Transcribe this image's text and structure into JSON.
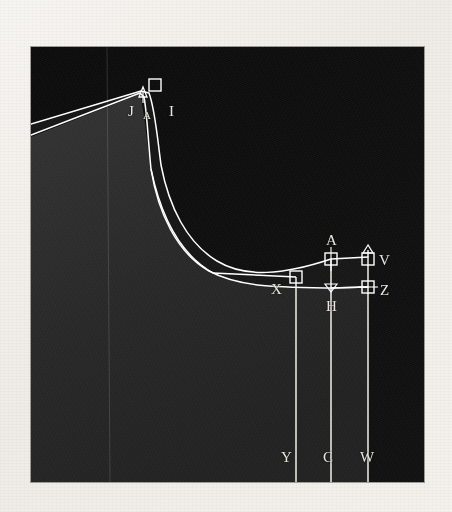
{
  "figure": {
    "kind": "annotated-contour-scan",
    "background_color": "#f4f2ee",
    "plate": {
      "x": 31,
      "y": 47,
      "width": 393,
      "height": 435,
      "dark_fill": "#0d0d0d",
      "mid_fill": "#2a2a2a",
      "trace_color": "#ffffff",
      "label_color": "#e9e6df"
    }
  },
  "labels": [
    {
      "id": "J",
      "text": "J",
      "x": 97,
      "y": 64,
      "size": "normal"
    },
    {
      "id": "A_peak",
      "text": "A",
      "x": 113,
      "y": 70,
      "size": "small"
    },
    {
      "id": "I",
      "text": "I",
      "x": 138,
      "y": 64,
      "size": "normal"
    },
    {
      "id": "A_right",
      "text": "A",
      "x": 287,
      "y": 188,
      "size": "normal"
    },
    {
      "id": "V",
      "text": "V",
      "x": 347,
      "y": 210,
      "size": "normal"
    },
    {
      "id": "X",
      "text": "X",
      "x": 237,
      "y": 235,
      "size": "normal"
    },
    {
      "id": "H",
      "text": "H",
      "x": 288,
      "y": 252,
      "size": "normal"
    },
    {
      "id": "Z",
      "text": "Z",
      "x": 350,
      "y": 238,
      "size": "normal"
    },
    {
      "id": "Y",
      "text": "Y",
      "x": 252,
      "y": 406,
      "size": "normal"
    },
    {
      "id": "C",
      "text": "C",
      "x": 288,
      "y": 406,
      "size": "normal"
    },
    {
      "id": "W",
      "text": "W",
      "x": 327,
      "y": 406,
      "size": "normal"
    }
  ],
  "markers": [
    {
      "id": "I",
      "shape": "square",
      "x": 123,
      "y": 38
    },
    {
      "id": "A_peak",
      "shape": "arrow-up",
      "x": 112,
      "y": 44
    },
    {
      "id": "A_right",
      "shape": "square",
      "x": 300,
      "y": 212
    },
    {
      "id": "V",
      "shape": "square",
      "x": 337,
      "y": 212
    },
    {
      "id": "V_tick",
      "shape": "arrow-up",
      "x": 337,
      "y": 203
    },
    {
      "id": "X",
      "shape": "square",
      "x": 265,
      "y": 230
    },
    {
      "id": "H",
      "shape": "arrow-down",
      "x": 300,
      "y": 241
    },
    {
      "id": "Z",
      "shape": "square",
      "x": 337,
      "y": 240
    }
  ],
  "vertical_rules": [
    {
      "id": "faint-left",
      "x": 76,
      "y_top": 0,
      "y_bottom": 435,
      "opacity": 0.22
    },
    {
      "id": "Y-rule",
      "x": 265,
      "y_top": 230,
      "y_bottom": 435,
      "opacity": 1
    },
    {
      "id": "C-rule",
      "x": 300,
      "y_top": 212,
      "y_bottom": 435,
      "opacity": 1
    },
    {
      "id": "W-rule",
      "x": 337,
      "y_top": 205,
      "y_bottom": 435,
      "opacity": 1
    }
  ],
  "traces": {
    "outer_curve": "M 0,77 L 110,44 L 118,46 C 124,62 126,88 130,118 C 138,160 156,196 186,214 C 214,231 252,228 300,212 L 337,210",
    "inner_curve": "M 0,88 L 109,46 L 113,50 C 116,66 117,92 120,122 C 127,166 146,206 178,224 C 208,240 242,240 300,241 L 337,240",
    "connector": "M 186,214 L 265,230"
  },
  "regions": {
    "upper_right_dark": "#0d0d0d",
    "lower_left_mid": "#2a2a2a",
    "band_fill": "#1a1a1a"
  }
}
